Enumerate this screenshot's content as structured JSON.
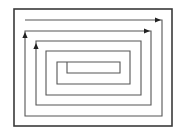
{
  "diagram": {
    "type": "rectangular-spiral",
    "background": "#ffffff",
    "frame": {
      "x": 14,
      "y": 9,
      "width": 158,
      "height": 117,
      "stroke": "#3a3a3a",
      "stroke_width": 1.6
    },
    "spiral": {
      "stroke": "#555555",
      "stroke_width": 1.1,
      "points": [
        [
          25,
          20
        ],
        [
          162,
          20
        ],
        [
          162,
          116
        ],
        [
          25,
          116
        ],
        [
          25,
          31
        ],
        [
          151,
          31
        ],
        [
          151,
          105
        ],
        [
          36,
          105
        ],
        [
          36,
          41
        ],
        [
          141,
          41
        ],
        [
          141,
          95
        ],
        [
          46,
          95
        ],
        [
          46,
          51
        ],
        [
          130,
          51
        ],
        [
          130,
          84
        ],
        [
          57,
          84
        ],
        [
          57,
          62
        ],
        [
          120,
          62
        ],
        [
          120,
          73
        ],
        [
          67,
          73
        ],
        [
          67,
          62
        ]
      ]
    },
    "arrows": [
      {
        "name": "arrow-right-top",
        "x": 158,
        "y": 20,
        "direction": "right"
      },
      {
        "name": "arrow-right-second",
        "x": 147,
        "y": 31,
        "direction": "right"
      },
      {
        "name": "arrow-up-left-outer",
        "x": 25,
        "y": 35,
        "direction": "up"
      },
      {
        "name": "arrow-up-left-inner",
        "x": 36,
        "y": 46,
        "direction": "up"
      }
    ],
    "arrow_color": "#222222"
  }
}
